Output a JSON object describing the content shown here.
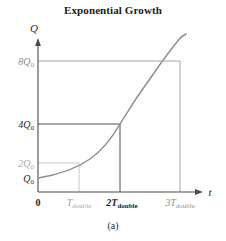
{
  "figure": {
    "title": "Exponential Growth",
    "caption": "(a)"
  },
  "axes": {
    "y_label": "Q",
    "x_label": "t",
    "origin_label": "0"
  },
  "y_ticks": [
    {
      "id": "8Q0",
      "coef": "8",
      "base": "Q",
      "sub": "0",
      "value": 8,
      "color": "#8f8f8f"
    },
    {
      "id": "4Q0",
      "coef": "4",
      "base": "Q",
      "sub": "0",
      "value": 4,
      "color": "#262626"
    },
    {
      "id": "2Q0",
      "coef": "2",
      "base": "Q",
      "sub": "0",
      "value": 2,
      "color": "#a8a8a8"
    },
    {
      "id": "Q0",
      "coef": "",
      "base": "Q",
      "sub": "0",
      "value": 1,
      "color": "#262626"
    }
  ],
  "x_ticks": [
    {
      "id": "T",
      "coef": "",
      "base": "T",
      "sub": "double",
      "value": 1,
      "color": "#a8a8a8",
      "bold": false
    },
    {
      "id": "2T",
      "coef": "2",
      "base": "T",
      "sub": "double",
      "value": 2,
      "color": "#262626",
      "bold": true
    },
    {
      "id": "3T",
      "coef": "3",
      "base": "T",
      "sub": "double",
      "value": 3,
      "color": "#8f8f8f",
      "bold": false
    }
  ],
  "labels": {
    "y8": "8Q",
    "y4": "4Q",
    "y2": "2Q",
    "y1": "Q",
    "sub_zero": "0",
    "x1_coef": "T",
    "x2_coef": "2T",
    "x3_coef": "3T",
    "sub_double": "double",
    "origin": "0",
    "t_axis": "t",
    "q_axis": "Q"
  },
  "colors": {
    "curve": "#8e8e8e",
    "axis": "#4a4a4a",
    "grid_dark": "#3a3a3a",
    "grid_gray": "#9a9a9a",
    "grid_light": "#c2c2c2",
    "background": "#ffffff"
  },
  "chart_data": {
    "type": "line",
    "title": "Exponential Growth",
    "subtitle": "(a)",
    "xlabel": "t",
    "ylabel": "Q",
    "grid": true,
    "legend": false,
    "function": "Q = Q0 * 2^(t / T_double)",
    "x_unit": "T_double",
    "y_unit": "Q0",
    "xlim": [
      0,
      3.35
    ],
    "ylim": [
      0,
      10.2
    ],
    "xtick_values": [
      0,
      1,
      2,
      3
    ],
    "xtick_labels": [
      "0",
      "T_double",
      "2T_double",
      "3T_double"
    ],
    "ytick_values": [
      1,
      2,
      4,
      8
    ],
    "ytick_labels": [
      "Q0",
      "2Q0",
      "4Q0",
      "8Q0"
    ],
    "series": [
      {
        "name": "Exponential growth curve",
        "x": [
          0,
          0.25,
          0.5,
          0.75,
          1,
          1.25,
          1.5,
          1.75,
          2,
          2.25,
          2.5,
          2.75,
          3,
          3.15
        ],
        "y": [
          1,
          1.19,
          1.41,
          1.68,
          2,
          2.38,
          2.83,
          3.36,
          4,
          4.76,
          5.66,
          6.73,
          8,
          8.88
        ]
      }
    ],
    "annotations": [
      {
        "kind": "guide",
        "at_x": 1,
        "at_y": 2,
        "note": "doubling at T_double, Q = 2Q0"
      },
      {
        "kind": "guide",
        "at_x": 2,
        "at_y": 4,
        "note": "doubling at 2T_double, Q = 4Q0"
      },
      {
        "kind": "guide",
        "at_x": 3,
        "at_y": 8,
        "note": "doubling at 3T_double, Q = 8Q0"
      }
    ]
  }
}
